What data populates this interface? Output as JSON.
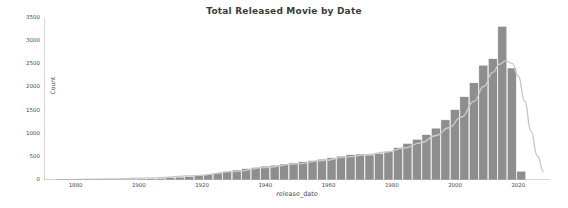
{
  "chart_data": {
    "type": "bar",
    "title": "Total Released Movie by Date",
    "xlabel": "release_date",
    "ylabel": "Count",
    "xlim": [
      1870,
      2030
    ],
    "ylim": [
      0,
      3500
    ],
    "grid": false,
    "legend": null,
    "bar_color": "#8e8e8e",
    "bar_edge_color": "#ffffff",
    "kde_color": "#c9c9c9",
    "xticks": [
      1880,
      1900,
      1920,
      1940,
      1960,
      1980,
      2000,
      2020
    ],
    "xtick_labels": [
      "1880",
      "1900",
      "1920",
      "1940",
      "1960",
      "1980",
      "2000",
      "2020"
    ],
    "yticks": [
      0,
      500,
      1000,
      1500,
      2000,
      2500,
      3000,
      3500
    ],
    "ytick_labels": [
      "0",
      "500",
      "1000",
      "1500",
      "2000",
      "2500",
      "3000",
      "3500"
    ],
    "categories": [
      1874,
      1877,
      1880,
      1883,
      1886,
      1889,
      1892,
      1895,
      1898,
      1901,
      1904,
      1907,
      1910,
      1913,
      1916,
      1919,
      1922,
      1925,
      1928,
      1931,
      1934,
      1937,
      1940,
      1943,
      1946,
      1949,
      1952,
      1955,
      1958,
      1961,
      1964,
      1967,
      1970,
      1973,
      1976,
      1979,
      1982,
      1985,
      1988,
      1991,
      1994,
      1997,
      2000,
      2003,
      2006,
      2009,
      2012,
      2015,
      2018,
      2021
    ],
    "values": [
      2,
      3,
      4,
      5,
      6,
      8,
      10,
      14,
      18,
      22,
      28,
      36,
      48,
      62,
      78,
      95,
      120,
      150,
      185,
      215,
      245,
      270,
      300,
      320,
      345,
      370,
      395,
      420,
      450,
      480,
      515,
      545,
      560,
      540,
      575,
      620,
      700,
      790,
      880,
      980,
      1120,
      1300,
      1520,
      1800,
      2100,
      2480,
      2620,
      3320,
      2420,
      190
    ],
    "kde": {
      "x": [
        1874,
        1890,
        1905,
        1918,
        1930,
        1940,
        1950,
        1958,
        1966,
        1972,
        1978,
        1984,
        1989,
        1994,
        1998,
        2002,
        2006,
        2009,
        2012,
        2014,
        2016,
        2018,
        2020,
        2022,
        2024,
        2026,
        2028
      ],
      "y": [
        8,
        20,
        45,
        95,
        180,
        270,
        350,
        420,
        500,
        545,
        600,
        690,
        800,
        960,
        1130,
        1360,
        1700,
        2020,
        2330,
        2500,
        2580,
        2520,
        2240,
        1700,
        1050,
        520,
        180
      ]
    }
  }
}
